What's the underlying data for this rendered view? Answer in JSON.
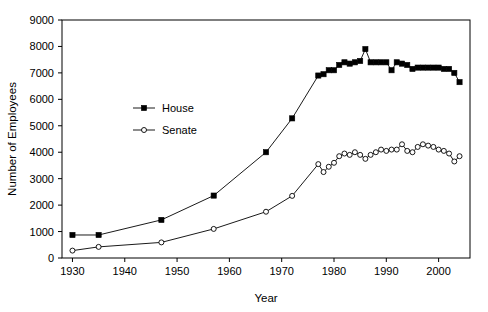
{
  "chart_data": {
    "type": "line",
    "title": "",
    "xlabel": "Year",
    "ylabel": "Number of Employees",
    "xlim": [
      1928,
      2006
    ],
    "ylim": [
      0,
      9000
    ],
    "xticks": [
      1930,
      1940,
      1950,
      1960,
      1970,
      1980,
      1990,
      2000
    ],
    "xtick_labels": [
      "1930",
      "1940",
      "1950",
      "1960",
      "1970",
      "1980",
      "1990",
      "2000"
    ],
    "yticks": [
      0,
      1000,
      2000,
      3000,
      4000,
      5000,
      6000,
      7000,
      8000,
      9000
    ],
    "ytick_labels": [
      "0",
      "1000",
      "2000",
      "3000",
      "4000",
      "5000",
      "6000",
      "7000",
      "8000",
      "9000"
    ],
    "grid": false,
    "legend_position": "upper-left-inset",
    "series": [
      {
        "name": "House",
        "marker": "filled-square",
        "color": "#000000",
        "x": [
          1930,
          1935,
          1947,
          1957,
          1967,
          1972,
          1977,
          1978,
          1979,
          1980,
          1981,
          1982,
          1983,
          1984,
          1985,
          1986,
          1987,
          1988,
          1989,
          1990,
          1991,
          1992,
          1993,
          1994,
          1995,
          1996,
          1997,
          1998,
          1999,
          2000,
          2001,
          2002,
          2003,
          2004
        ],
        "values": [
          870,
          870,
          1440,
          2360,
          4000,
          5280,
          6900,
          6950,
          7100,
          7100,
          7300,
          7400,
          7350,
          7400,
          7450,
          7900,
          7400,
          7400,
          7400,
          7400,
          7100,
          7400,
          7350,
          7300,
          7150,
          7200,
          7200,
          7200,
          7200,
          7200,
          7150,
          7150,
          7000,
          6650
        ]
      },
      {
        "name": "Senate",
        "marker": "open-circle",
        "color": "#000000",
        "x": [
          1930,
          1935,
          1947,
          1957,
          1967,
          1972,
          1977,
          1978,
          1979,
          1980,
          1981,
          1982,
          1983,
          1984,
          1985,
          1986,
          1987,
          1988,
          1989,
          1990,
          1991,
          1992,
          1993,
          1994,
          1995,
          1996,
          1997,
          1998,
          1999,
          2000,
          2001,
          2002,
          2003,
          2004
        ],
        "values": [
          280,
          420,
          590,
          1100,
          1750,
          2350,
          3550,
          3250,
          3450,
          3600,
          3850,
          3950,
          3900,
          4000,
          3900,
          3750,
          3900,
          4000,
          4100,
          4050,
          4100,
          4100,
          4300,
          4050,
          4000,
          4200,
          4300,
          4250,
          4200,
          4100,
          4050,
          3950,
          3650,
          3850
        ]
      }
    ]
  },
  "legend": {
    "entries": [
      {
        "label": "House"
      },
      {
        "label": "Senate"
      }
    ]
  }
}
